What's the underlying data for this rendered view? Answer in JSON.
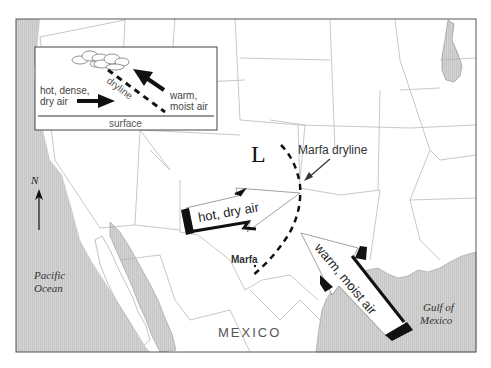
{
  "map": {
    "title": "Marfa dryline",
    "low_pressure_symbol": "L",
    "dryline_label": "Marfa dryline",
    "city_label": "Marfa",
    "country_label": "MEXICO",
    "water_labels": {
      "pacific": [
        "Pacific",
        "Ocean"
      ],
      "gulf": [
        "Gulf of",
        "Mexico"
      ]
    },
    "compass": {
      "letter": "N",
      "icon": "north-arrow-icon"
    },
    "arrows": {
      "hot_dry": "hot, dry air",
      "warm_moist": "warm, moist air"
    },
    "colors": {
      "water": "#cfcfcf",
      "land": "#ffffff",
      "borders": "#a8a8a8",
      "ink": "#111111"
    }
  },
  "inset": {
    "left_label": [
      "hot, dense,",
      "dry air"
    ],
    "right_label": [
      "warm,",
      "moist air"
    ],
    "dryline_label": "dryline",
    "surface_label": "surface"
  }
}
